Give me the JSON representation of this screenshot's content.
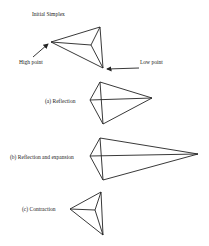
{
  "title": "Initial Simplex",
  "annotations": {
    "high_point": "High point",
    "low_point": "Low point"
  },
  "panels": [
    {
      "id": "initial",
      "label": "Initial Simplex"
    },
    {
      "id": "reflection",
      "label": "(a) Reflection"
    },
    {
      "id": "expansion",
      "label": "(b) Reflection and expansion"
    },
    {
      "id": "contraction",
      "label": "(c) Contraction"
    }
  ],
  "colors": {
    "stroke": "#222222",
    "background": "#ffffff"
  }
}
